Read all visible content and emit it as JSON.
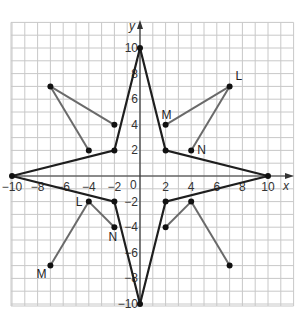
{
  "diagram": {
    "type": "coordinate-plane",
    "axes": {
      "x_label": "x",
      "y_label": "y",
      "x_range": [
        -10,
        12
      ],
      "y_range": [
        -10,
        12
      ],
      "grid_step": 1,
      "origin_label": "0",
      "x_ticks": [
        {
          "value": -10,
          "label": "−10"
        },
        {
          "value": -8,
          "label": "−8"
        },
        {
          "value": -6,
          "label": "−6"
        },
        {
          "value": -4,
          "label": "−4"
        },
        {
          "value": -2,
          "label": "−2"
        },
        {
          "value": 2,
          "label": "2"
        },
        {
          "value": 4,
          "label": "4"
        },
        {
          "value": 6,
          "label": "6"
        },
        {
          "value": 8,
          "label": "8"
        },
        {
          "value": 10,
          "label": "10"
        }
      ],
      "y_ticks": [
        {
          "value": 10,
          "label": "10"
        },
        {
          "value": 8,
          "label": "8"
        },
        {
          "value": 6,
          "label": "6"
        },
        {
          "value": 4,
          "label": "4"
        },
        {
          "value": 2,
          "label": "2"
        },
        {
          "value": -2,
          "label": "−2"
        },
        {
          "value": -4,
          "label": "−4"
        },
        {
          "value": -6,
          "label": "−6"
        },
        {
          "value": -8,
          "label": "−8"
        },
        {
          "value": -10,
          "label": "−10"
        }
      ]
    },
    "star": {
      "color": "#1e1e1e",
      "vertices": [
        [
          0,
          10
        ],
        [
          2,
          2
        ],
        [
          10,
          0
        ],
        [
          2,
          -2
        ],
        [
          0,
          -10
        ],
        [
          -2,
          -2
        ],
        [
          -10,
          0
        ],
        [
          -2,
          2
        ]
      ]
    },
    "triangles": [
      {
        "quadrant": "I",
        "color": "#6a6a6a",
        "points": [
          {
            "name": "L",
            "x": 7,
            "y": 7,
            "label": "L"
          },
          {
            "name": "M",
            "x": 2,
            "y": 4,
            "label": "M"
          },
          {
            "name": "N",
            "x": 4,
            "y": 2,
            "label": "N"
          }
        ]
      },
      {
        "quadrant": "II",
        "color": "#6a6a6a",
        "points": [
          {
            "name": "A",
            "x": -7,
            "y": 7,
            "label": ""
          },
          {
            "name": "B",
            "x": -2,
            "y": 4,
            "label": ""
          },
          {
            "name": "C",
            "x": -4,
            "y": 2,
            "label": ""
          }
        ]
      },
      {
        "quadrant": "III",
        "color": "#6a6a6a",
        "points": [
          {
            "name": "L",
            "x": -4,
            "y": -2,
            "label": "L"
          },
          {
            "name": "M",
            "x": -7,
            "y": -7,
            "label": "M"
          },
          {
            "name": "N",
            "x": -2,
            "y": -4,
            "label": "N"
          }
        ]
      },
      {
        "quadrant": "IV",
        "color": "#6a6a6a",
        "points": [
          {
            "name": "A",
            "x": 4,
            "y": -2,
            "label": ""
          },
          {
            "name": "B",
            "x": 7,
            "y": -7,
            "label": ""
          },
          {
            "name": "C",
            "x": 2,
            "y": -4,
            "label": ""
          }
        ]
      }
    ]
  }
}
